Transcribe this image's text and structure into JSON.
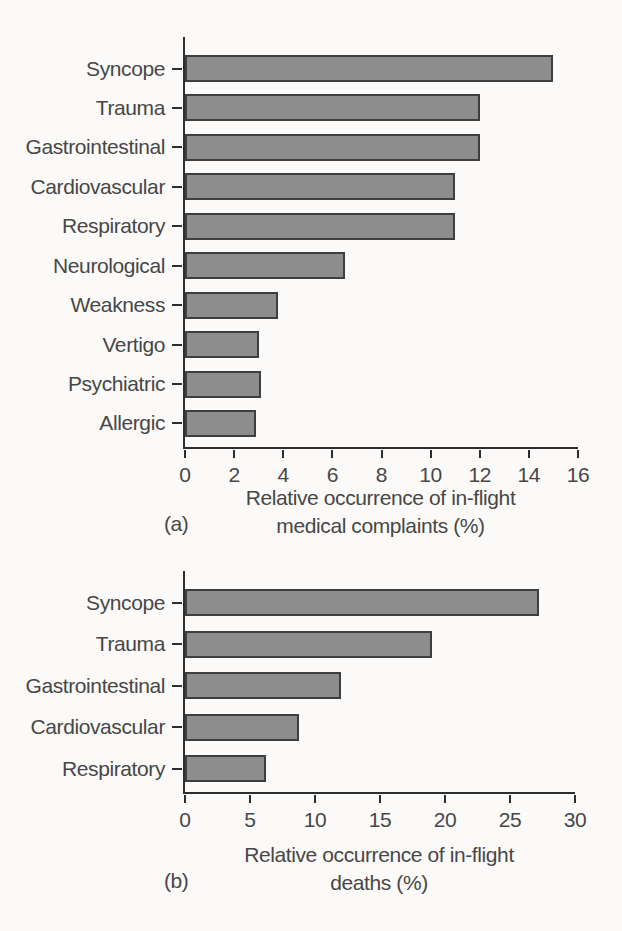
{
  "page": {
    "background_color": "#fbfaf8",
    "text_color": "#474747",
    "axis_color": "#2e2e2e",
    "bar_color": "#8d8d8d",
    "bar_border_color": "#3e3e3e"
  },
  "chart_data": [
    {
      "type": "bar",
      "orientation": "horizontal",
      "panel_label": "(a)",
      "categories": [
        "Syncope",
        "Trauma",
        "Gastrointestinal",
        "Cardiovascular",
        "Respiratory",
        "Neurological",
        "Weakness",
        "Vertigo",
        "Psychiatric",
        "Allergic"
      ],
      "values": [
        15,
        12,
        12,
        11,
        11,
        6.5,
        3.8,
        3.0,
        3.1,
        2.9
      ],
      "xlim": [
        0,
        16
      ],
      "xticks": [
        0,
        2,
        4,
        6,
        8,
        10,
        12,
        14,
        16
      ],
      "xlabel_line1": "Relative occurrence of in-flight",
      "xlabel_line2": "medical complaints (%)",
      "grid": false,
      "legend": null
    },
    {
      "type": "bar",
      "orientation": "horizontal",
      "panel_label": "(b)",
      "categories": [
        "Syncope",
        "Trauma",
        "Gastrointestinal",
        "Cardiovascular",
        "Respiratory"
      ],
      "values": [
        27.2,
        19,
        12,
        8.8,
        6.2
      ],
      "xlim": [
        0,
        30
      ],
      "xticks": [
        0,
        5,
        10,
        15,
        20,
        25,
        30
      ],
      "xlabel_line1": "Relative occurrence of in-flight",
      "xlabel_line2": "deaths (%)",
      "grid": false,
      "legend": null
    }
  ]
}
